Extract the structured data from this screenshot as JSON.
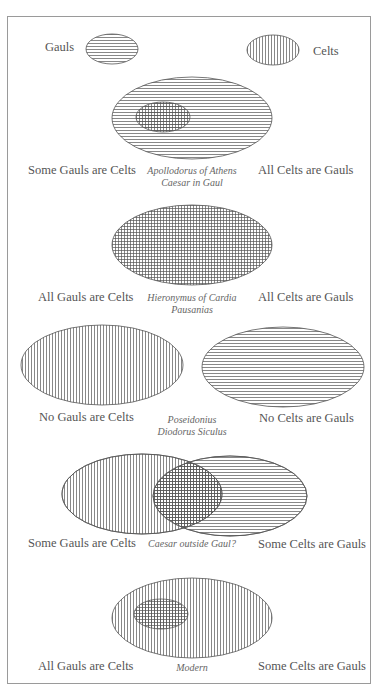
{
  "legend": {
    "gauls_label": "Gauls",
    "celts_label": "Celts",
    "gauls_pattern": "horizontal-hatch",
    "celts_pattern": "vertical-hatch"
  },
  "panels": [
    {
      "left_label": "Some Gauls are Celts",
      "right_label": "All Celts are Gauls",
      "sources": [
        "Apollodorus of Athens",
        "Caesar in Gaul"
      ]
    },
    {
      "left_label": "All Gauls are Celts",
      "right_label": "All Celts are Gauls",
      "sources": [
        "Hieronymus of Cardia",
        "Pausanias"
      ]
    },
    {
      "left_label": "No Gauls are Celts",
      "right_label": "No Celts are Gauls",
      "sources": [
        "Poseidonius",
        "Diodorus Siculus"
      ]
    },
    {
      "left_label": "Some Gauls are Celts",
      "right_label": "Some Celts are Gauls",
      "sources": [
        "Caesar outside Gaul?"
      ]
    },
    {
      "left_label": "All Gauls are Celts",
      "right_label": "Some Celts are Gauls",
      "sources": [
        "Modern"
      ]
    }
  ],
  "colors": {
    "line": "#555555",
    "frame": "#9a9a9a",
    "background": "#ffffff"
  }
}
